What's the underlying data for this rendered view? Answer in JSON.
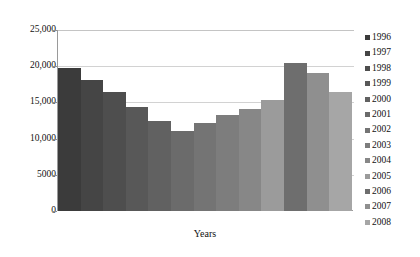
{
  "chart_data": {
    "type": "bar",
    "title": "",
    "xlabel": "Years",
    "ylabel": "",
    "categories": [
      "1996",
      "1997",
      "1998",
      "1999",
      "2000",
      "2001",
      "2002",
      "2003",
      "2004",
      "2005",
      "2006",
      "2007",
      "2008"
    ],
    "values": [
      19800,
      18100,
      16400,
      14300,
      12500,
      11100,
      12100,
      13300,
      14100,
      15400,
      20400,
      19100,
      16400
    ],
    "ylim": [
      0,
      25000
    ],
    "ytick_labels": [
      "25,000",
      "20,000",
      "15,000",
      "10,000",
      "5000",
      "0"
    ],
    "ytick_values": [
      25000,
      20000,
      15000,
      10000,
      5000,
      0
    ],
    "grid": true,
    "legend_position": "right",
    "series_colors": [
      "#3b3b3b",
      "#454545",
      "#4e4e4e",
      "#585858",
      "#616161",
      "#6b6b6b",
      "#747474",
      "#7d7d7d",
      "#878787",
      "#9b9b9b",
      "#6e6e6e",
      "#8f8f8f",
      "#a6a6a6"
    ]
  },
  "legend": {
    "items": [
      {
        "label": "1996",
        "color": "#3b3b3b"
      },
      {
        "label": "1997",
        "color": "#454545"
      },
      {
        "label": "1998",
        "color": "#4e4e4e"
      },
      {
        "label": "1999",
        "color": "#585858"
      },
      {
        "label": "2000",
        "color": "#616161"
      },
      {
        "label": "2001",
        "color": "#6b6b6b"
      },
      {
        "label": "2002",
        "color": "#747474"
      },
      {
        "label": "2003",
        "color": "#7d7d7d"
      },
      {
        "label": "2004",
        "color": "#878787"
      },
      {
        "label": "2005",
        "color": "#9b9b9b"
      },
      {
        "label": "2006",
        "color": "#6e6e6e"
      },
      {
        "label": "2007",
        "color": "#8f8f8f"
      },
      {
        "label": "2008",
        "color": "#a6a6a6"
      }
    ]
  }
}
